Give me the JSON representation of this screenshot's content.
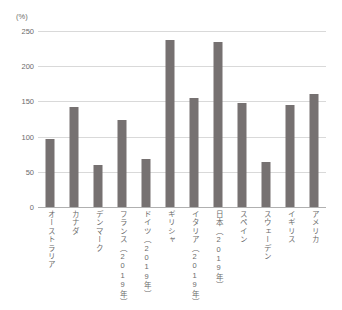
{
  "chart_data": {
    "type": "bar",
    "title": "",
    "subtitle": "",
    "xlabel": "",
    "ylabel": "(%)",
    "unit_label": "(%)",
    "ylim": [
      0,
      250
    ],
    "ytick_values": [
      0,
      50,
      100,
      150,
      200,
      250
    ],
    "ytick_labels": [
      "0",
      "50",
      "100",
      "150",
      "200",
      "250"
    ],
    "grid": true,
    "legend": null,
    "legend_position": "none",
    "bar_color": "#767171",
    "gridline_color": "#D9D9D9",
    "axis_color": "#B0B0B0",
    "text_color": "#6B6B6B",
    "categories": [
      "オーストラリア",
      "カナダ",
      "デンマーク",
      "フランス（2019年）",
      "ドイツ（2019年）",
      "ギリシャ",
      "イタリア（2019年）",
      "日本（2019年）",
      "スペイン",
      "スウェーデン",
      "イギリス",
      "アメリカ"
    ],
    "values": [
      97,
      142,
      59,
      124,
      68,
      237,
      155,
      234,
      148,
      64,
      145,
      161
    ]
  }
}
